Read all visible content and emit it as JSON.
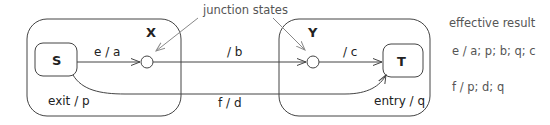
{
  "diagram": {
    "type": "statechart",
    "annotation": "junction states",
    "states": {
      "X": {
        "label": "X",
        "exit_action": "exit / p"
      },
      "S": {
        "label": "S"
      },
      "Y": {
        "label": "Y",
        "entry_action": "entry / q"
      },
      "T": {
        "label": "T"
      }
    },
    "transitions": [
      {
        "from": "S",
        "to": "junction1",
        "label": "e / a"
      },
      {
        "from": "junction1",
        "to": "junction2",
        "label": "/ b"
      },
      {
        "from": "junction2",
        "to": "T",
        "label": "/ c"
      },
      {
        "from": "S",
        "to": "T",
        "label": "f / d"
      }
    ]
  },
  "result": {
    "title": "effective result",
    "lines": [
      "e / a; p; b; q; c",
      "f / p; d; q"
    ]
  },
  "colors": {
    "stroke": "#444444",
    "annotation_arrow": "#888888",
    "text": "#222222",
    "result_text": "#555555"
  }
}
